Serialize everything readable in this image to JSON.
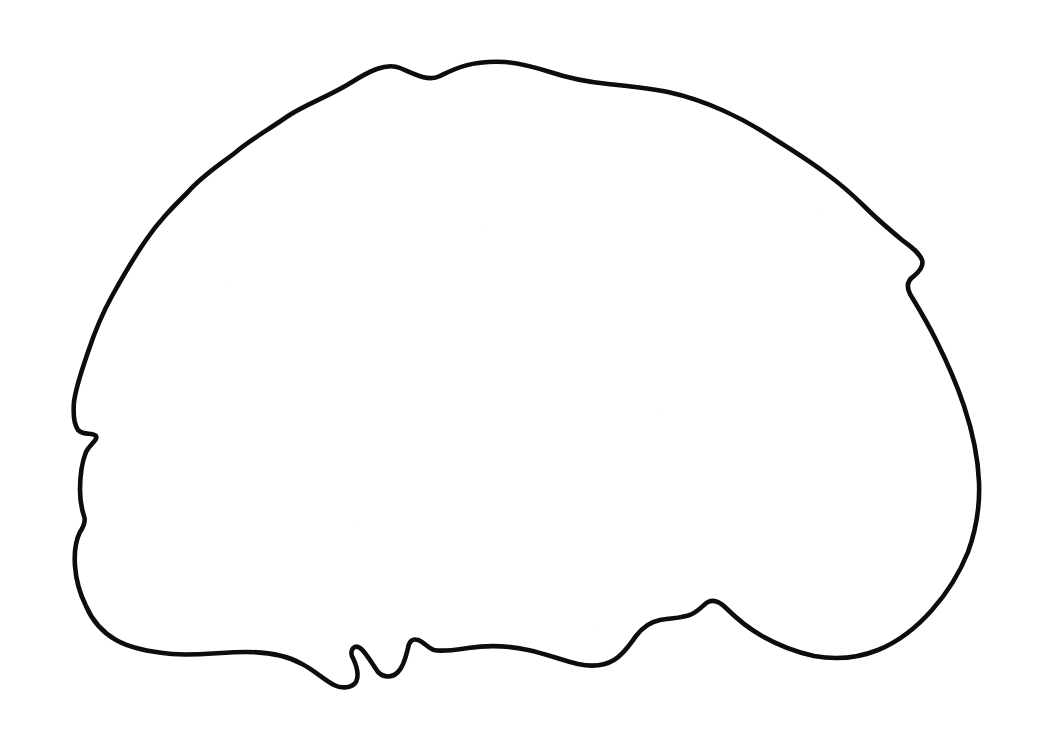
{
  "document": {
    "kind": "line-drawing",
    "subject": "brain-outline",
    "view": "lateral-sagittal",
    "title": "Hand-drawn brain outline contour",
    "canvas": {
      "width": 1047,
      "height": 751,
      "background_color": "#ffffff"
    },
    "text_content": [],
    "labels": [],
    "annotations": []
  },
  "style": {
    "stroke_color": "#0d0d0d",
    "stroke_width": 4.6,
    "fill": "none",
    "line_cap": "round",
    "line_join": "round"
  },
  "shape": {
    "closed": true,
    "bounds": {
      "left": 74,
      "top": 62,
      "right": 979,
      "bottom": 688
    },
    "extrema": {
      "topmost": {
        "x": 505,
        "y": 62
      },
      "leftmost": {
        "x": 74,
        "y": 400
      },
      "rightmost": {
        "x": 979,
        "y": 478
      },
      "bottommost": {
        "x": 345,
        "y": 686
      }
    },
    "features": [
      {
        "name": "dorsal-convexity",
        "description": "broad rounded top arc with small gyral undulations"
      },
      {
        "name": "frontal-pole",
        "description": "left-side rounded front at x 74-110"
      },
      {
        "name": "frontal-notch-upper",
        "description": "inward cusp on left margin at about (95, 435)"
      },
      {
        "name": "frontal-notch-lower",
        "description": "second inward cusp on left margin at about (83, 523)"
      },
      {
        "name": "temporal-pole-base",
        "description": "bottom-left turn near (120, 640)"
      },
      {
        "name": "inferior-notch-pair",
        "description": "two sharp downward cusps at bottom center near x 345 and x 400"
      },
      {
        "name": "brainstem-step",
        "description": "step up on inferior margin near (700, 605)"
      },
      {
        "name": "occipital-pole",
        "description": "smooth right arc sweeping from (979, 478) down to (790, 655)"
      }
    ],
    "path": "M 505 62 C 470 60 452 70 440 76 C 428 82 414 74 400 68 C 386 62 368 72 352 82 C 330 96 306 104 288 116 C 268 130 250 140 236 152 C 218 166 202 176 188 192 C 172 208 158 222 146 240 C 132 260 122 278 112 296 C 102 314 94 334 88 352 C 82 370 76 386 74 402 C 73 414 74 424 78 430 C 84 436 92 432 96 436 C 98 440 90 444 86 452 C 82 462 80 476 80 490 C 80 502 82 510 84 516 C 86 521 84 526 80 532 C 76 540 74 552 75 566 C 76 580 80 594 86 606 C 92 620 102 632 116 640 C 130 648 150 652 172 654 C 196 656 222 652 246 652 C 268 652 288 656 302 664 C 314 670 324 680 334 685 C 342 689 352 688 356 682 C 360 674 356 664 352 656 C 350 650 354 644 360 648 C 366 652 372 664 378 672 C 384 678 392 678 398 672 C 404 666 406 656 408 648 C 409 642 412 638 418 640 C 424 642 428 648 434 650 C 442 652 454 650 468 648 C 488 645 510 646 528 650 C 546 654 562 660 578 664 C 592 667 604 666 614 660 C 624 654 630 644 636 636 C 642 628 650 622 660 620 C 672 618 684 618 692 614 C 700 610 704 604 708 602 C 714 599 720 602 726 608 C 736 618 748 628 762 636 C 778 645 796 652 814 656 C 836 660 858 658 878 650 C 898 642 916 628 932 610 C 948 592 960 572 968 552 C 976 530 980 506 979 482 C 978 456 972 430 964 406 C 956 382 946 360 936 340 C 926 320 916 304 910 294 C 906 286 908 280 914 276 C 920 271 924 266 922 260 C 919 252 910 246 902 240 C 890 230 878 220 866 208 C 852 194 838 182 824 172 C 808 160 792 150 776 140 C 758 128 740 118 722 110 C 704 102 686 96 668 92 C 648 88 628 86 608 84 C 588 82 568 78 550 72 C 534 67 518 63 505 62 Z"
  }
}
